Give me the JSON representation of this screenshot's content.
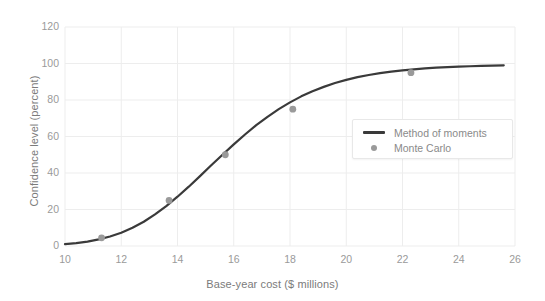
{
  "chart_data": {
    "type": "line",
    "title": "",
    "xlabel": "Base-year cost ($ millions)",
    "ylabel": "Confidence level (percent)",
    "xlim": [
      10,
      26
    ],
    "ylim": [
      0,
      120
    ],
    "xticks": [
      10,
      12,
      14,
      16,
      18,
      20,
      22,
      24,
      26
    ],
    "yticks": [
      0,
      20,
      40,
      60,
      80,
      100,
      120
    ],
    "grid": true,
    "legend_position": "center-right",
    "series": [
      {
        "name": "Method of moments",
        "type": "line",
        "color": "#3a3a3a",
        "x": [
          10.0,
          10.4,
          10.8,
          11.2,
          11.6,
          12.0,
          12.4,
          12.8,
          13.2,
          13.6,
          14.0,
          14.4,
          14.8,
          15.2,
          15.6,
          16.0,
          16.4,
          16.8,
          17.2,
          17.6,
          18.0,
          18.4,
          18.8,
          19.2,
          19.6,
          20.0,
          20.4,
          20.8,
          21.2,
          21.6,
          22.0,
          22.4,
          22.8,
          23.2,
          23.6,
          24.0,
          24.4,
          24.8,
          25.2,
          25.6
        ],
        "y": [
          1.0,
          1.6,
          2.4,
          3.6,
          5.2,
          7.3,
          10.0,
          13.3,
          17.3,
          21.9,
          27.0,
          32.5,
          38.3,
          44.2,
          50.0,
          55.7,
          61.1,
          66.2,
          70.8,
          75.0,
          78.7,
          82.0,
          84.8,
          87.2,
          89.3,
          91.0,
          92.5,
          93.7,
          94.7,
          95.5,
          96.2,
          96.8,
          97.3,
          97.7,
          98.0,
          98.3,
          98.5,
          98.7,
          98.8,
          99.0
        ]
      },
      {
        "name": "Monte Carlo",
        "type": "scatter",
        "color": "#9a9a9a",
        "x": [
          11.3,
          13.7,
          15.7,
          18.1,
          22.3
        ],
        "y": [
          4.5,
          25.0,
          50.0,
          75.0,
          95.0
        ]
      }
    ]
  },
  "legend": {
    "items": [
      {
        "label": "Method of moments",
        "marker": "line"
      },
      {
        "label": "Monte Carlo",
        "marker": "dot"
      }
    ]
  },
  "colors": {
    "line": "#3a3a3a",
    "marker": "#9a9a9a",
    "grid": "#ededed",
    "tick_text": "#9a9a9a",
    "axis_label_text": "#7b7b7b",
    "background": "#ffffff"
  }
}
